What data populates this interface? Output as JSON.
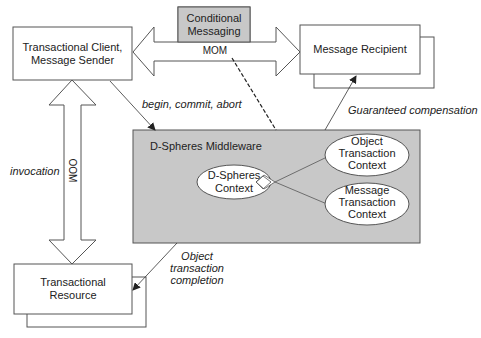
{
  "nodes": {
    "client": {
      "label_line1": "Transactional Client,",
      "label_line2": "Message Sender"
    },
    "recipient": {
      "label": "Message Recipient"
    },
    "conditional": {
      "label_line1": "Conditional",
      "label_line2": "Messaging"
    },
    "resource": {
      "label_line1": "Transactional",
      "label_line2": "Resource"
    },
    "middleware": {
      "title": "D-Spheres Middleware",
      "dspheres_context": {
        "line1": "D-Spheres",
        "line2": "Context"
      },
      "object_context": {
        "line1": "Object",
        "line2": "Transaction",
        "line3": "Context"
      },
      "message_context": {
        "line1": "Message",
        "line2": "Transaction",
        "line3": "Context"
      }
    }
  },
  "edges": {
    "mom": {
      "label": "MOM"
    },
    "oom": {
      "label": "OOM"
    },
    "begin_commit_abort": {
      "label": "begin, commit, abort"
    },
    "guaranteed_compensation": {
      "label": "Guaranteed compensation"
    },
    "invocation": {
      "label": "invocation"
    },
    "object_completion": {
      "line1": "Object",
      "line2": "transaction",
      "line3": "completion"
    }
  },
  "colors": {
    "gray_fill": "#c8c8c8",
    "stroke": "#444444",
    "background": "#ffffff"
  }
}
